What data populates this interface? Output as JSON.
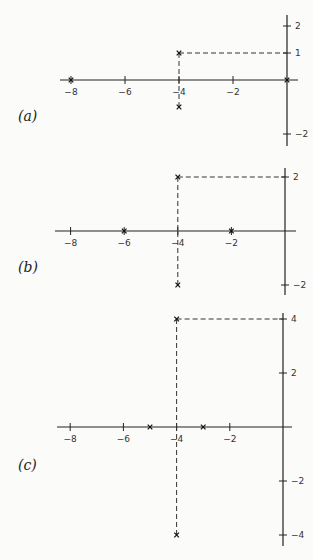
{
  "chart_data": [
    {
      "type": "scatter",
      "panel_label": "(a)",
      "marker": "x",
      "poles": [
        {
          "re": -8,
          "im": 0
        },
        {
          "re": 0,
          "im": 0
        },
        {
          "re": -4,
          "im": 1
        },
        {
          "re": -4,
          "im": -1
        }
      ],
      "real_ticks": [
        -8,
        -6,
        -4,
        -2
      ],
      "real_tick_labels": [
        "−8",
        "−6",
        "−4",
        "−2"
      ],
      "imag_ticks": [
        2,
        1,
        -2
      ],
      "imag_tick_labels": [
        "2",
        "1",
        "−2"
      ],
      "xlim": [
        -8.5,
        0.3
      ],
      "ylim": [
        -2.4,
        2.4
      ]
    },
    {
      "type": "scatter",
      "panel_label": "(b)",
      "marker": "x",
      "poles": [
        {
          "re": -6,
          "im": 0
        },
        {
          "re": -2,
          "im": 0
        },
        {
          "re": -4,
          "im": 2
        },
        {
          "re": -4,
          "im": -2
        }
      ],
      "real_ticks": [
        -8,
        -6,
        -4,
        -2
      ],
      "real_tick_labels": [
        "−8",
        "−6",
        "−4",
        "−2"
      ],
      "imag_ticks": [
        2,
        -2
      ],
      "imag_tick_labels": [
        "2",
        "−2"
      ],
      "xlim": [
        -8.5,
        0.3
      ],
      "ylim": [
        -2.4,
        2.4
      ]
    },
    {
      "type": "scatter",
      "panel_label": "(c)",
      "marker": "x",
      "poles": [
        {
          "re": -5,
          "im": 0
        },
        {
          "re": -3,
          "im": 0
        },
        {
          "re": -4,
          "im": 4
        },
        {
          "re": -4,
          "im": -4
        }
      ],
      "real_ticks": [
        -8,
        -6,
        -4,
        -2
      ],
      "real_tick_labels": [
        "−8",
        "−6",
        "−4",
        "−2"
      ],
      "imag_ticks": [
        4,
        2,
        -2,
        -4
      ],
      "imag_tick_labels": [
        "4",
        "2",
        "−2",
        "−4"
      ],
      "xlim": [
        -8.5,
        0.3
      ],
      "ylim": [
        -4.3,
        4.3
      ]
    }
  ]
}
